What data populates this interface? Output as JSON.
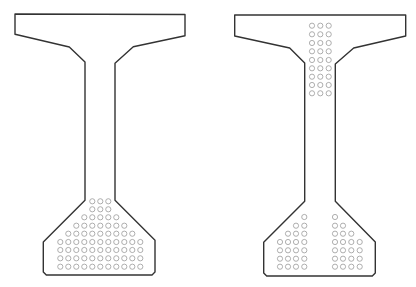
{
  "diagram": {
    "type": "cross-section",
    "colors": {
      "outline": "#333333",
      "strand": "#9a9a9a",
      "background": "#ffffff"
    },
    "strand_radius": 2.6,
    "beams": [
      {
        "name": "left-beam",
        "outline_points": [
          [
            15,
            14
          ],
          [
            185,
            14.5
          ],
          [
            185,
            35.7
          ],
          [
            133.3,
            46.7
          ],
          [
            115,
            63.3
          ],
          [
            115,
            200.3
          ],
          [
            155,
            240.3
          ],
          [
            155,
            272
          ],
          [
            152,
            275
          ],
          [
            46.3,
            275
          ],
          [
            43.3,
            272
          ],
          [
            43.3,
            242
          ],
          [
            85,
            200.3
          ],
          [
            85,
            62
          ],
          [
            69.3,
            47
          ],
          [
            15,
            34.3
          ]
        ],
        "strand_groups": [
          {
            "name": "bottom-strands",
            "rows": [
              {
                "y": 201.3,
                "x": [
                  92.3,
                  100.3,
                  108.3
                ]
              },
              {
                "y": 209.3,
                "x": [
                  92.3,
                  100.3,
                  108.3
                ]
              },
              {
                "y": 217.3,
                "x": [
                  84.3,
                  92.3,
                  100.3,
                  108.3,
                  116.3
                ]
              },
              {
                "y": 225.7,
                "x": [
                  76.3,
                  84.3,
                  92.3,
                  100.3,
                  108.3,
                  116.3,
                  124.3
                ]
              },
              {
                "y": 233.7,
                "x": [
                  68.3,
                  76.3,
                  84.3,
                  92.3,
                  100.3,
                  108.3,
                  116.3,
                  124.3,
                  132.3
                ]
              },
              {
                "y": 242,
                "x": [
                  60.3,
                  68.3,
                  76.3,
                  84.3,
                  92.3,
                  100.3,
                  108.3,
                  116.3,
                  124.3,
                  132.3,
                  140.3
                ]
              },
              {
                "y": 250,
                "x": [
                  60.3,
                  68.3,
                  76.3,
                  84.3,
                  92.3,
                  100.3,
                  108.3,
                  116.3,
                  124.3,
                  132.3,
                  140.3
                ]
              },
              {
                "y": 258.3,
                "x": [
                  60.3,
                  68.3,
                  76.3,
                  84.3,
                  92.3,
                  100.3,
                  108.3,
                  116.3,
                  124.3,
                  132.3,
                  140.3
                ]
              },
              {
                "y": 266.7,
                "x": [
                  60.3,
                  68.3,
                  76.3,
                  84.3,
                  92.3,
                  100.3,
                  108.3,
                  116.3,
                  124.3,
                  132.3,
                  140.3
                ]
              }
            ]
          }
        ]
      },
      {
        "name": "right-beam",
        "outline_points": [
          [
            234.7,
            15
          ],
          [
            405.7,
            15
          ],
          [
            405.7,
            36
          ],
          [
            353.7,
            48
          ],
          [
            335.3,
            64
          ],
          [
            335.3,
            201.3
          ],
          [
            375.3,
            242
          ],
          [
            375.3,
            273
          ],
          [
            372.3,
            276
          ],
          [
            266.7,
            276
          ],
          [
            263.7,
            273
          ],
          [
            263.7,
            242.3
          ],
          [
            304.7,
            201.3
          ],
          [
            304.7,
            63
          ],
          [
            289.7,
            48
          ],
          [
            234.7,
            36
          ]
        ],
        "strand_groups": [
          {
            "name": "top-web-strands",
            "rows": [
              {
                "y": 25.7,
                "x": [
                  312,
                  320.3,
                  328.7
                ]
              },
              {
                "y": 34.3,
                "x": [
                  312,
                  320.3,
                  328.7
                ]
              },
              {
                "y": 43,
                "x": [
                  312,
                  320.3,
                  328.7
                ]
              },
              {
                "y": 51.3,
                "x": [
                  312,
                  320.3,
                  328.7
                ]
              },
              {
                "y": 60,
                "x": [
                  312,
                  320.3,
                  328.7
                ]
              },
              {
                "y": 68.3,
                "x": [
                  312,
                  320.3,
                  328.7
                ]
              },
              {
                "y": 76.7,
                "x": [
                  312,
                  320.3,
                  328.7
                ]
              },
              {
                "y": 85,
                "x": [
                  312,
                  320.3,
                  328.7
                ]
              },
              {
                "y": 93.3,
                "x": [
                  312,
                  320.3,
                  328.7
                ]
              }
            ]
          },
          {
            "name": "bottom-left-strands",
            "rows": [
              {
                "y": 217,
                "x": [
                  304.3
                ]
              },
              {
                "y": 225.7,
                "x": [
                  296,
                  304.3
                ]
              },
              {
                "y": 233.7,
                "x": [
                  288,
                  296,
                  304.3
                ]
              },
              {
                "y": 242,
                "x": [
                  280,
                  288,
                  296,
                  304.3
                ]
              },
              {
                "y": 250.3,
                "x": [
                  280,
                  288,
                  296,
                  304.3
                ]
              },
              {
                "y": 258.7,
                "x": [
                  280,
                  288,
                  296,
                  304.3
                ]
              },
              {
                "y": 266.7,
                "x": [
                  280,
                  288,
                  296,
                  304.3
                ]
              }
            ]
          },
          {
            "name": "bottom-right-strands",
            "rows": [
              {
                "y": 217,
                "x": [
                  335
                ]
              },
              {
                "y": 225.7,
                "x": [
                  335,
                  343
                ]
              },
              {
                "y": 233.7,
                "x": [
                  335,
                  343,
                  351.3
                ]
              },
              {
                "y": 242,
                "x": [
                  335,
                  343,
                  351.3,
                  359.7
                ]
              },
              {
                "y": 250.3,
                "x": [
                  335,
                  343,
                  351.3,
                  359.7
                ]
              },
              {
                "y": 258.7,
                "x": [
                  335,
                  343,
                  351.3,
                  359.7
                ]
              },
              {
                "y": 266.7,
                "x": [
                  335,
                  343,
                  351.3,
                  359.7
                ]
              }
            ]
          }
        ]
      }
    ]
  }
}
